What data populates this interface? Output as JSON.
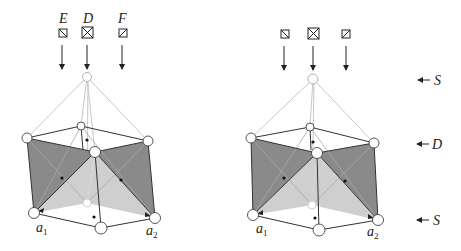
{
  "figure": {
    "type": "crystal-structure-diagram",
    "panels": [
      {
        "id": "left",
        "column_labels": [
          "E",
          "D",
          "F"
        ],
        "column_symbols": [
          "box-backslash",
          "box-cross",
          "box-slash"
        ],
        "basis_labels": {
          "a1": "a",
          "a1_sub": "1",
          "a2": "a",
          "a2_sub": "2"
        }
      },
      {
        "id": "right",
        "column_labels": [
          "",
          "",
          ""
        ],
        "column_symbols": [
          "box-backslash",
          "box-cross",
          "box-slash"
        ],
        "basis_labels": {
          "a1": "a",
          "a1_sub": "1",
          "a2": "a",
          "a2_sub": "2"
        }
      }
    ],
    "layer_labels": [
      {
        "label": "S",
        "position": "top"
      },
      {
        "label": "D",
        "position": "middle"
      },
      {
        "label": "S",
        "position": "bottom"
      }
    ]
  },
  "colors": {
    "dark_face": "#8a8a8a",
    "light_face": "#cfcfcf",
    "edge": "#333333",
    "faint_edge": "#c8c8c8"
  }
}
